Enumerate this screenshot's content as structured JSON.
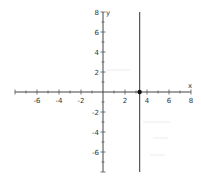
{
  "chart_data": {
    "type": "line",
    "title": "",
    "xlabel": "x",
    "ylabel": "y",
    "xlim": [
      -8,
      8
    ],
    "ylim": [
      -8,
      8
    ],
    "grid": false,
    "x_ticks": [
      -8,
      -7,
      -6,
      -5,
      -4,
      -3,
      -2,
      -1,
      1,
      2,
      3,
      4,
      5,
      6,
      7,
      8
    ],
    "y_ticks": [
      -8,
      -7,
      -6,
      -5,
      -4,
      -3,
      -2,
      -1,
      1,
      2,
      3,
      4,
      5,
      6,
      7,
      8
    ],
    "x_tick_labels": [
      {
        "value": -6,
        "label": "-6"
      },
      {
        "value": -4,
        "label": "-4"
      },
      {
        "value": -2,
        "label": "-2"
      },
      {
        "value": 2,
        "label": "2"
      },
      {
        "value": 4,
        "label": "4"
      },
      {
        "value": 6,
        "label": "6"
      },
      {
        "value": 8,
        "label": "8"
      }
    ],
    "y_tick_labels": [
      {
        "value": 8,
        "label": "8"
      },
      {
        "value": 6,
        "label": "6"
      },
      {
        "value": 4,
        "label": "4"
      },
      {
        "value": 2,
        "label": "2"
      },
      {
        "value": -2,
        "label": "-2"
      },
      {
        "value": -4,
        "label": "-4"
      },
      {
        "value": -6,
        "label": "-6"
      }
    ],
    "series": [
      {
        "name": "vertical line",
        "equation": "x = 10/3",
        "x": [
          3.33,
          3.33
        ],
        "y": [
          -8,
          8
        ],
        "color": "#555555"
      }
    ],
    "points": [
      {
        "name": "x-intercept",
        "x": 3.33,
        "y": 0,
        "color": "#111111"
      }
    ]
  }
}
